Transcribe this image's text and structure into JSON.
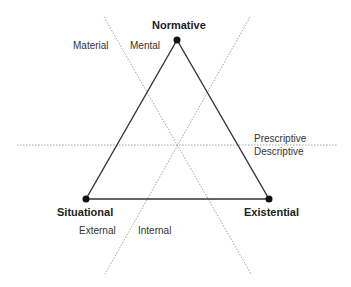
{
  "diagram": {
    "type": "triangle-perspectives",
    "vertices": [
      {
        "id": "normative",
        "label": "Normative",
        "x": 177,
        "y": 40
      },
      {
        "id": "situational",
        "label": "Situational",
        "x": 86,
        "y": 199
      },
      {
        "id": "existential",
        "label": "Existential",
        "x": 269,
        "y": 199
      }
    ],
    "edges": [
      {
        "from": "normative",
        "to": "situational"
      },
      {
        "from": "normative",
        "to": "existential"
      },
      {
        "from": "situational",
        "to": "existential"
      }
    ],
    "dividers": [
      {
        "style": "dotted",
        "x1": 104,
        "y1": 17,
        "x2": 251,
        "y2": 274,
        "left_label": "Material",
        "right_label": "Mental"
      },
      {
        "style": "dotted",
        "x1": 250,
        "y1": 17,
        "x2": 105,
        "y2": 274,
        "left_label": "External",
        "right_label": "Internal"
      },
      {
        "style": "dotted",
        "x1": 17,
        "y1": 145,
        "x2": 337,
        "y2": 145,
        "above_label": "Prescriptive",
        "below_label": "Descriptive"
      }
    ],
    "labels": {
      "normative": "Normative",
      "situational": "Situational",
      "existential": "Existential",
      "material": "Material",
      "mental": "Mental",
      "prescriptive": "Prescriptive",
      "descriptive": "Descriptive",
      "external": "External",
      "internal": "Internal"
    },
    "colors": {
      "edge": "#333333",
      "divider": "#888888",
      "node": "#111111"
    }
  }
}
